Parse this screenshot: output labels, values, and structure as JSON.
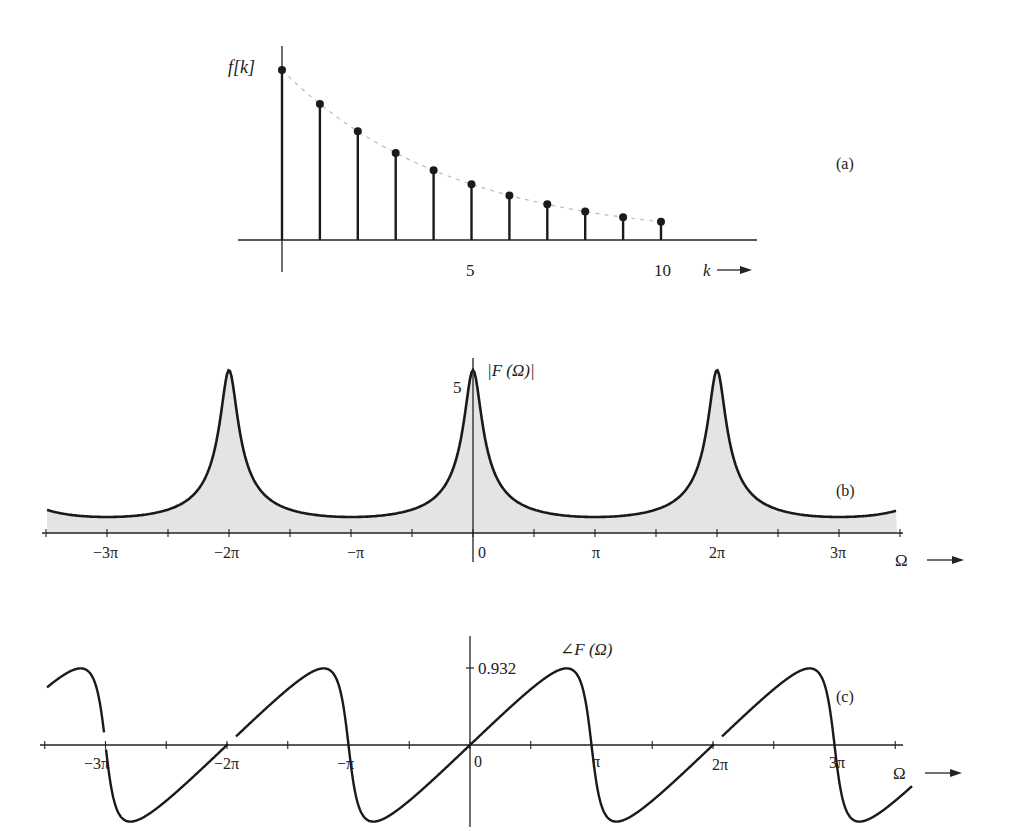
{
  "chart_data": [
    {
      "type": "scatter",
      "subtype": "stem",
      "panel_label": "(a)",
      "ylabel": "f[k]",
      "xlabel": "k",
      "x": [
        0,
        1,
        2,
        3,
        4,
        5,
        6,
        7,
        8,
        9,
        10
      ],
      "values": [
        1.0,
        0.8,
        0.64,
        0.512,
        0.41,
        0.328,
        0.262,
        0.21,
        0.168,
        0.134,
        0.107
      ],
      "x_ticks": [
        {
          "value": 5,
          "label": "5"
        },
        {
          "value": 10,
          "label": "10"
        }
      ],
      "envelope": "dashed exponential decay"
    },
    {
      "type": "area",
      "panel_label": "(b)",
      "ylabel": "|F(Ω)|",
      "xlabel": "Ω",
      "peak_value": 5,
      "y_ticks": [
        {
          "value": 5,
          "label": "5"
        }
      ],
      "x_ticks": [
        {
          "value": -3,
          "label": "−3π"
        },
        {
          "value": -2,
          "label": "−2π"
        },
        {
          "value": -1,
          "label": "−π"
        },
        {
          "value": 0,
          "label": "0"
        },
        {
          "value": 1,
          "label": "π"
        },
        {
          "value": 2,
          "label": "2π"
        },
        {
          "value": 3,
          "label": "3π"
        }
      ],
      "xrange_pi": [
        -3.5,
        3.5
      ],
      "description": "Periodic magnitude spectrum with peaks of 5 at Ω = −2π, 0, 2π"
    },
    {
      "type": "line",
      "panel_label": "(c)",
      "ylabel": "∠F(Ω)",
      "xlabel": "Ω",
      "y_ticks": [
        {
          "value": 0.932,
          "label": "0.932"
        }
      ],
      "x_ticks": [
        {
          "value": -3,
          "label": "−3π"
        },
        {
          "value": -2,
          "label": "−2π"
        },
        {
          "value": -1,
          "label": "−π"
        },
        {
          "value": 0,
          "label": "0"
        },
        {
          "value": 1,
          "label": "π"
        },
        {
          "value": 2,
          "label": "2π"
        },
        {
          "value": 3,
          "label": "3π"
        }
      ],
      "max_value": 0.932,
      "description": "Periodic phase spectrum, odd, zero crossings at multiples of π"
    }
  ],
  "labels": {
    "a": {
      "panel": "(a)",
      "ylabel": "f[k]",
      "xlabel": "k",
      "tick5": "5",
      "tick10": "10"
    },
    "b": {
      "panel": "(b)",
      "ylabel": "|F (Ω)|",
      "peak": "5",
      "xlabel": "Ω",
      "ticks": [
        "−3π",
        "−2π",
        "−π",
        "0",
        "π",
        "2π",
        "3π"
      ]
    },
    "c": {
      "panel": "(c)",
      "ylabel": "∠F (Ω)",
      "ymax": "0.932",
      "xlabel": "Ω",
      "ticks": [
        "−3π",
        "−2π",
        "−π",
        "0",
        "π",
        "2π",
        "3π"
      ]
    }
  }
}
